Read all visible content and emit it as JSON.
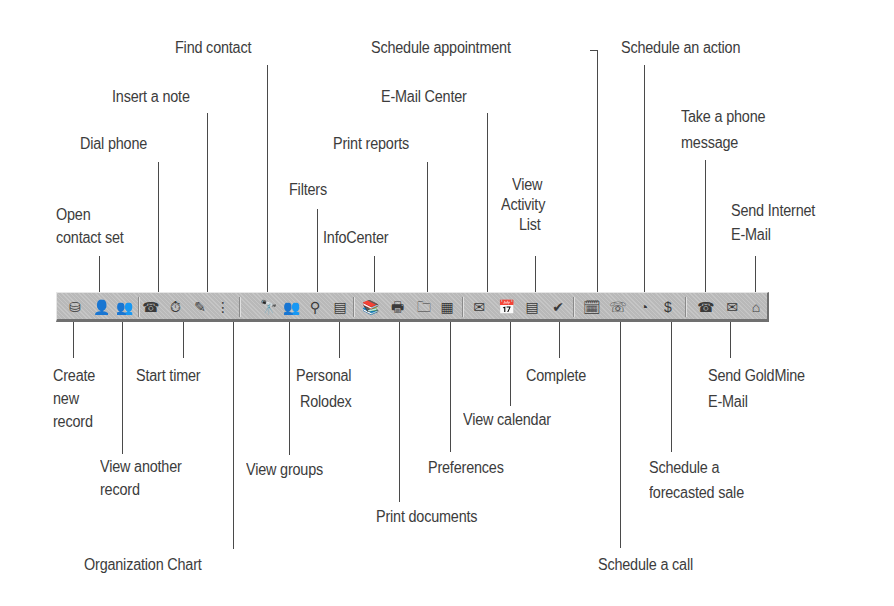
{
  "diagram": {
    "toolbar": {
      "background": "#b9b9b9",
      "groups": [
        [
          "open-contact-set",
          "create-new-record",
          "view-another-record"
        ],
        [
          "dial-phone",
          "start-timer",
          "insert-a-note",
          "organization-chart"
        ],
        [
          "find-contact",
          "view-groups",
          "filters",
          "personal-rolodex"
        ],
        [
          "infocenter",
          "print-documents",
          "print-reports",
          "preferences"
        ],
        [
          "e-mail-center",
          "view-calendar",
          "view-activity-list",
          "complete"
        ],
        [
          "schedule-appointment",
          "schedule-a-call",
          "schedule-an-action",
          "schedule-a-forecasted-sale"
        ],
        [
          "take-a-phone-message",
          "send-goldmine-e-mail",
          "send-internet-e-mail"
        ]
      ]
    },
    "labels_above": {
      "find_contact": "Find contact",
      "schedule_appointment": "Schedule appointment",
      "schedule_an_action": "Schedule an action",
      "insert_a_note": "Insert a note",
      "e_mail_center": "E-Mail Center",
      "dial_phone": "Dial phone",
      "print_reports": "Print reports",
      "take_a_phone_message_1": "Take a phone",
      "take_a_phone_message_2": "message",
      "filters": "Filters",
      "view_activity_list_1": "View",
      "view_activity_list_2": "Activity",
      "view_activity_list_3": "List",
      "open_contact_set_1": "Open",
      "open_contact_set_2": "contact set",
      "infocenter": "InfoCenter",
      "send_internet_email_1": "Send Internet",
      "send_internet_email_2": "E-Mail"
    },
    "labels_below": {
      "create_new_record_1": "Create",
      "create_new_record_2": "new",
      "create_new_record_3": "record",
      "start_timer": "Start timer",
      "personal_rolodex_1": "Personal",
      "personal_rolodex_2": "Rolodex",
      "complete": "Complete",
      "send_goldmine_email_1": "Send GoldMine",
      "send_goldmine_email_2": "E-Mail",
      "view_calendar": "View calendar",
      "view_another_record_1": "View another",
      "view_another_record_2": "record",
      "view_groups": "View groups",
      "preferences": "Preferences",
      "schedule_forecasted_sale_1": "Schedule a",
      "schedule_forecasted_sale_2": "forecasted sale",
      "print_documents": "Print documents",
      "organization_chart": "Organization Chart",
      "schedule_a_call": "Schedule a call"
    },
    "icons": {
      "open_contact_set": "⛁",
      "create_new_record": "👤",
      "view_another_record": "👥",
      "dial_phone": "☎",
      "start_timer": "⏱",
      "insert_a_note": "✎",
      "organization_chart": "⋮",
      "find_contact": "🔭",
      "view_groups": "👥",
      "filters": "⚲",
      "personal_rolodex": "▤",
      "infocenter": "📚",
      "print_documents": "🖶",
      "print_reports": "🗀",
      "preferences": "▦",
      "e_mail_center": "✉",
      "view_calendar": "📅",
      "view_activity_list": "▤",
      "complete": "✔",
      "schedule_appointment": "🗓",
      "schedule_a_call": "☏",
      "schedule_an_action": "◔",
      "schedule_forecasted_sale": "$",
      "take_a_phone_message": "☎",
      "send_goldmine_email": "✉",
      "send_internet_email": "⌂"
    }
  }
}
